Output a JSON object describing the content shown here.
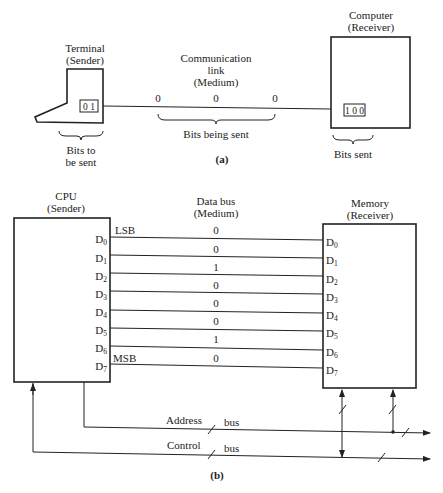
{
  "part_a": {
    "terminal": {
      "title": "Terminal",
      "role": "(Sender)",
      "bits": "0 1"
    },
    "link": {
      "title": "Communication",
      "title2": "link",
      "role": "(Medium)",
      "bits": [
        "0",
        "0",
        "0"
      ],
      "brace_label": "Bits being sent"
    },
    "computer": {
      "title": "Computer",
      "role": "(Receiver)",
      "bits": "1 0 0"
    },
    "terminal_brace": {
      "line1": "Bits to",
      "line2": "be sent"
    },
    "computer_brace": {
      "label": "Bits sent"
    },
    "caption": "(a)"
  },
  "part_b": {
    "cpu": {
      "title": "CPU",
      "role": "(Sender)"
    },
    "bus": {
      "title": "Data bus",
      "role": "(Medium)"
    },
    "memory": {
      "title": "Memory",
      "role": "(Receiver)"
    },
    "lsb_label": "LSB",
    "msb_label": "MSB",
    "lines": [
      {
        "pin": "D",
        "sub": "0",
        "bit": "0"
      },
      {
        "pin": "D",
        "sub": "1",
        "bit": "0"
      },
      {
        "pin": "D",
        "sub": "2",
        "bit": "1"
      },
      {
        "pin": "D",
        "sub": "3",
        "bit": "0"
      },
      {
        "pin": "D",
        "sub": "4",
        "bit": "0"
      },
      {
        "pin": "D",
        "sub": "5",
        "bit": "0"
      },
      {
        "pin": "D",
        "sub": "6",
        "bit": "1"
      },
      {
        "pin": "D",
        "sub": "7",
        "bit": "0"
      }
    ],
    "address_bus": {
      "label": "Address",
      "suffix": "bus"
    },
    "control_bus": {
      "label": "Control",
      "suffix": "bus"
    },
    "caption": "(b)"
  }
}
